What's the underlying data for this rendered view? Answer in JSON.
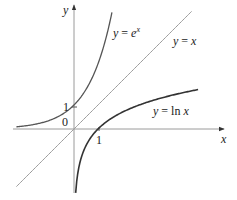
{
  "chart_data": {
    "type": "line",
    "title": "",
    "xlabel": "x",
    "ylabel": "y",
    "origin_label": "0",
    "x_ticks": [
      {
        "value": 1,
        "label": "1"
      }
    ],
    "y_ticks": [
      {
        "value": 1,
        "label": "1"
      }
    ],
    "grid": false,
    "xlim": [
      -2.5,
      5.4
    ],
    "ylim": [
      -2.7,
      5.1
    ],
    "series": [
      {
        "name": "y = e^x",
        "label_prefix": "y = e",
        "label_sup": "x",
        "function": "exp",
        "domain": [
          -2.4,
          1.58
        ],
        "points": [
          [
            -2.4,
            0.09
          ],
          [
            -2,
            0.14
          ],
          [
            -1,
            0.37
          ],
          [
            0,
            1
          ],
          [
            0.5,
            1.65
          ],
          [
            1,
            2.72
          ],
          [
            1.5,
            4.48
          ],
          [
            1.58,
            4.85
          ]
        ],
        "color": "#555555"
      },
      {
        "name": "y = x",
        "label": "y = x",
        "function": "identity",
        "domain": [
          -2.4,
          4.9
        ],
        "points": [
          [
            -2.4,
            -2.4
          ],
          [
            0,
            0
          ],
          [
            1,
            1
          ],
          [
            4.9,
            4.9
          ]
        ],
        "color": "#9a9a9a"
      },
      {
        "name": "y = ln x",
        "label_prefix": "y = ln ",
        "label_var": "x",
        "function": "ln",
        "domain": [
          0.07,
          5.17
        ],
        "points": [
          [
            0.07,
            -2.66
          ],
          [
            0.25,
            -1.39
          ],
          [
            0.5,
            -0.69
          ],
          [
            1,
            0
          ],
          [
            2,
            0.69
          ],
          [
            3,
            1.1
          ],
          [
            4,
            1.39
          ],
          [
            5.17,
            1.64
          ]
        ],
        "color": "#333333"
      }
    ]
  }
}
